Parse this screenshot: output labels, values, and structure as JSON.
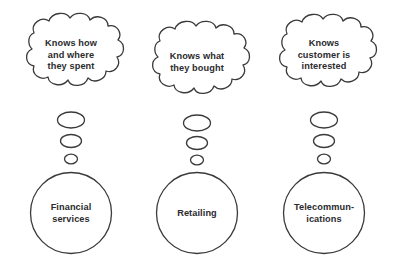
{
  "diagram": {
    "background_color": "#ffffff",
    "stroke_color": "#3a3a3c",
    "text_color": "#2b2b2d",
    "groups": [
      {
        "id": "financial-services",
        "cloud": {
          "lines": [
            "Knows how",
            "and where",
            "they spent"
          ]
        },
        "bubbles": [
          "large",
          "medium",
          "small"
        ],
        "circle": {
          "lines": [
            "Financial",
            "services"
          ]
        }
      },
      {
        "id": "retailing",
        "cloud": {
          "lines": [
            "Knows what",
            "they bought"
          ]
        },
        "bubbles": [
          "large",
          "medium",
          "small"
        ],
        "circle": {
          "lines": [
            "Retailing"
          ]
        }
      },
      {
        "id": "telecommunications",
        "cloud": {
          "lines": [
            "Knows",
            "customer is",
            "interested"
          ]
        },
        "bubbles": [
          "large",
          "medium",
          "small"
        ],
        "circle": {
          "lines": [
            "Telecommun-",
            "ications"
          ]
        }
      }
    ]
  }
}
